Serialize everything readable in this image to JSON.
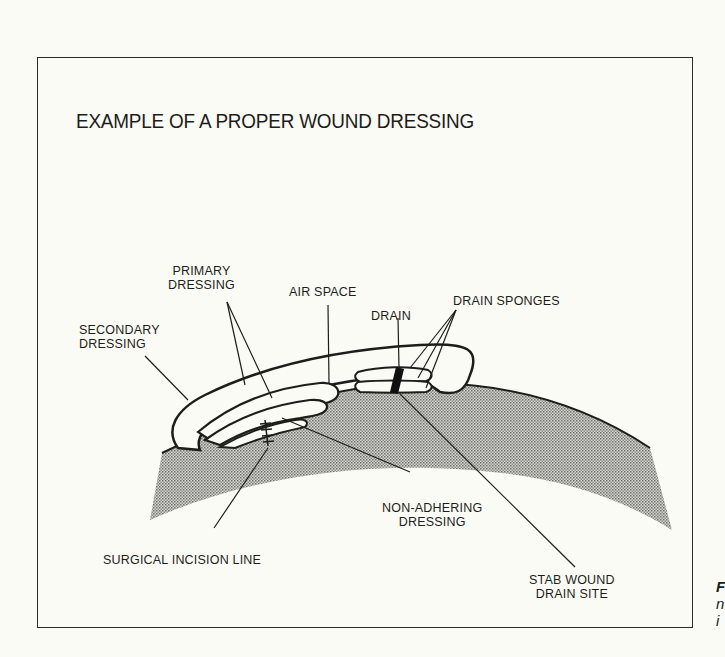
{
  "figure": {
    "title": "EXAMPLE OF A PROPER WOUND DRESSING",
    "labels": {
      "primary_dressing": [
        "PRIMARY",
        "DRESSING"
      ],
      "secondary_dressing": [
        "SECONDARY",
        "DRESSING"
      ],
      "air_space": "AIR SPACE",
      "drain": "DRAIN",
      "drain_sponges": "DRAIN SPONGES",
      "non_adhering_dressing": [
        "NON-ADHERING",
        "DRESSING"
      ],
      "surgical_incision_line": "SURGICAL INCISION LINE",
      "stab_wound_drain_site": [
        "STAB WOUND",
        "DRAIN SITE"
      ]
    },
    "cropped_caption_fragment": [
      "F",
      "n",
      "i"
    ]
  },
  "colors": {
    "background": "#fbfbf5",
    "ink": "#1d1d1b",
    "skin_stipple": "#a8a8a4"
  }
}
